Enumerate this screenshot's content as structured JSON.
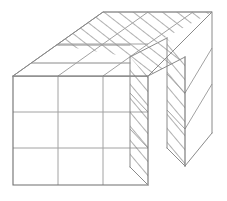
{
  "figure": {
    "title": "Cuboid with stepped notch, grid-ruled and section-hatched",
    "caption": "",
    "kind": "isometric-solid-diagram",
    "background_color": "#ffffff",
    "edge_color": "#8a8a8a",
    "grid_color": "#a2a2a2",
    "hatch_color": "#555555",
    "faces": [
      {
        "name": "front-face",
        "style": "plain",
        "rows": 3,
        "cols": 3,
        "cells": 9
      },
      {
        "name": "top-face",
        "style": "plain-with-grid",
        "rows": 1,
        "cols": 3
      },
      {
        "name": "top-cut-band",
        "style": "hatched",
        "rows": 2,
        "cols": 3
      },
      {
        "name": "notch-inner-face",
        "style": "hatched",
        "rows": 3,
        "cols": 1
      },
      {
        "name": "notch-outer-face",
        "style": "hatched",
        "rows": 3,
        "cols": 1
      },
      {
        "name": "right-side-face",
        "style": "plain-with-grid",
        "rows": 3,
        "cols": 1
      }
    ],
    "counts": {
      "front_columns": 3,
      "front_rows": 3,
      "depth_layers": 3,
      "hatched_faces": 3
    },
    "labels": []
  }
}
